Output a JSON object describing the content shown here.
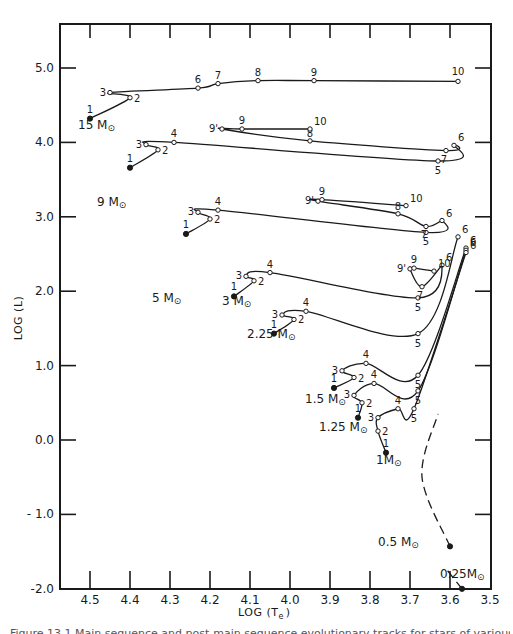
{
  "chart_data": {
    "type": "line",
    "title": "",
    "xlabel": "LOG (Te)",
    "ylabel": "LOG (L)",
    "xlim": [
      4.57,
      3.5
    ],
    "ylim": [
      -2.0,
      5.6
    ],
    "x_inverted": true,
    "grid": false,
    "x_ticks": [
      "4.5",
      "4.4",
      "4.3",
      "4.2",
      "4.1",
      "4.0",
      "3.9",
      "3.8",
      "3.7",
      "3.6",
      "3.5"
    ],
    "y_ticks": [
      "5.0",
      "4.0",
      "3.0",
      "2.0",
      "1.0",
      "0.0",
      "- 1.0",
      "-2.0"
    ],
    "series": [
      {
        "name": "15 M☉",
        "points": [
          {
            "label": "1",
            "x": 4.5,
            "y": 4.32,
            "start": true
          },
          {
            "label": "2",
            "x": 4.4,
            "y": 4.6
          },
          {
            "label": "3",
            "x": 4.45,
            "y": 4.67
          },
          {
            "label": "6",
            "x": 4.23,
            "y": 4.73
          },
          {
            "label": "7",
            "x": 4.18,
            "y": 4.79
          },
          {
            "label": "8",
            "x": 4.08,
            "y": 4.83
          },
          {
            "label": "9",
            "x": 3.94,
            "y": 4.83
          },
          {
            "label": "10",
            "x": 3.58,
            "y": 4.82
          }
        ]
      },
      {
        "name": "9 M☉",
        "points": [
          {
            "label": "1",
            "x": 4.4,
            "y": 3.66,
            "start": true
          },
          {
            "label": "2",
            "x": 4.33,
            "y": 3.9
          },
          {
            "label": "3",
            "x": 4.36,
            "y": 3.97
          },
          {
            "label": "4",
            "x": 4.29,
            "y": 4.0
          },
          {
            "label": "5",
            "x": 3.63,
            "y": 3.75
          },
          {
            "label": "6",
            "x": 3.59,
            "y": 3.96
          },
          {
            "label": "7",
            "x": 3.61,
            "y": 3.89
          },
          {
            "label": "8",
            "x": 3.95,
            "y": 4.02
          },
          {
            "label": "9'",
            "x": 4.17,
            "y": 4.18
          },
          {
            "label": "9",
            "x": 4.12,
            "y": 4.18
          },
          {
            "label": "10",
            "x": 3.95,
            "y": 4.18
          }
        ]
      },
      {
        "name": "5 M☉",
        "points": [
          {
            "label": "1",
            "x": 4.26,
            "y": 2.77,
            "start": true
          },
          {
            "label": "2",
            "x": 4.2,
            "y": 2.97
          },
          {
            "label": "3",
            "x": 4.23,
            "y": 3.06
          },
          {
            "label": "4",
            "x": 4.18,
            "y": 3.09
          },
          {
            "label": "5",
            "x": 3.66,
            "y": 2.79
          },
          {
            "label": "6",
            "x": 3.62,
            "y": 2.95
          },
          {
            "label": "7",
            "x": 3.66,
            "y": 2.87
          },
          {
            "label": "8",
            "x": 3.73,
            "y": 3.04
          },
          {
            "label": "9'",
            "x": 3.93,
            "y": 3.21
          },
          {
            "label": "9",
            "x": 3.92,
            "y": 3.23
          },
          {
            "label": "10",
            "x": 3.71,
            "y": 3.15
          }
        ]
      },
      {
        "name": "3 M☉",
        "points": [
          {
            "label": "1",
            "x": 4.14,
            "y": 1.93,
            "start": true
          },
          {
            "label": "2",
            "x": 4.09,
            "y": 2.14
          },
          {
            "label": "3",
            "x": 4.11,
            "y": 2.2
          },
          {
            "label": "4",
            "x": 4.05,
            "y": 2.25
          },
          {
            "label": "5",
            "x": 3.68,
            "y": 1.91
          },
          {
            "label": "6",
            "x": 3.62,
            "y": 2.35
          },
          {
            "label": "7",
            "x": 3.67,
            "y": 2.06
          },
          {
            "label": "9'",
            "x": 3.7,
            "y": 2.3
          },
          {
            "label": "9",
            "x": 3.69,
            "y": 2.31
          },
          {
            "label": "10",
            "x": 3.64,
            "y": 2.27
          }
        ]
      },
      {
        "name": "2.25 M☉",
        "points": [
          {
            "label": "1",
            "x": 4.04,
            "y": 1.43,
            "start": true
          },
          {
            "label": "2",
            "x": 3.99,
            "y": 1.62
          },
          {
            "label": "3",
            "x": 4.02,
            "y": 1.68
          },
          {
            "label": "4",
            "x": 3.96,
            "y": 1.73
          },
          {
            "label": "5",
            "x": 3.68,
            "y": 1.43
          },
          {
            "label": "6",
            "x": 3.58,
            "y": 2.73
          }
        ]
      },
      {
        "name": "1.5 M☉",
        "points": [
          {
            "label": "1",
            "x": 3.89,
            "y": 0.7,
            "start": true
          },
          {
            "label": "2",
            "x": 3.84,
            "y": 0.84
          },
          {
            "label": "3",
            "x": 3.87,
            "y": 0.93
          },
          {
            "label": "4",
            "x": 3.81,
            "y": 1.03
          },
          {
            "label": "5",
            "x": 3.68,
            "y": 0.87
          },
          {
            "label": "6",
            "x": 3.56,
            "y": 2.58
          }
        ]
      },
      {
        "name": "1.25 M☉",
        "points": [
          {
            "label": "1",
            "x": 3.83,
            "y": 0.3,
            "start": true
          },
          {
            "label": "2",
            "x": 3.82,
            "y": 0.5
          },
          {
            "label": "3",
            "x": 3.84,
            "y": 0.6
          },
          {
            "label": "4",
            "x": 3.79,
            "y": 0.76
          },
          {
            "label": "5",
            "x": 3.68,
            "y": 0.66
          },
          {
            "label": "6",
            "x": 3.56,
            "y": 2.55
          }
        ]
      },
      {
        "name": "1 M☉",
        "points": [
          {
            "label": "1",
            "x": 3.76,
            "y": -0.17,
            "start": true
          },
          {
            "label": "2",
            "x": 3.78,
            "y": 0.12
          },
          {
            "label": "3",
            "x": 3.78,
            "y": 0.3
          },
          {
            "label": "4",
            "x": 3.73,
            "y": 0.42
          },
          {
            "label": "5",
            "x": 3.69,
            "y": 0.42
          },
          {
            "label": "6",
            "x": 3.56,
            "y": 2.52
          }
        ]
      },
      {
        "name": "0.5 M☉",
        "dashed": true,
        "points": [
          {
            "label": "",
            "x": 3.6,
            "y": -1.43,
            "start": true
          },
          {
            "label": "",
            "x": 3.67,
            "y": -0.5
          },
          {
            "label": "",
            "x": 3.63,
            "y": 0.35
          }
        ]
      },
      {
        "name": "0.25 M☉",
        "dashed": true,
        "points": [
          {
            "label": "",
            "x": 3.57,
            "y": -2.0,
            "start": true
          },
          {
            "label": "",
            "x": 3.61,
            "y": -1.73
          }
        ]
      }
    ]
  },
  "axes": {
    "x_label": "LOG (T",
    "x_label_sub": "e",
    "x_label_end": ")",
    "y_label": "LOG (L)"
  },
  "mass_labels": {
    "m15": "15 M",
    "m9": "9 M",
    "m5": "5 M",
    "m3": "3 M",
    "m225": "2.25 M",
    "m15b": "1.5 M",
    "m125": "1.25 M",
    "m1": "1M",
    "m05": "0.5 M",
    "m025": "0.25M"
  },
  "sun_symbol": "⊙",
  "caption": "Figure 13.1  Main sequence and post-main sequence evolutionary tracks for stars of various masses"
}
